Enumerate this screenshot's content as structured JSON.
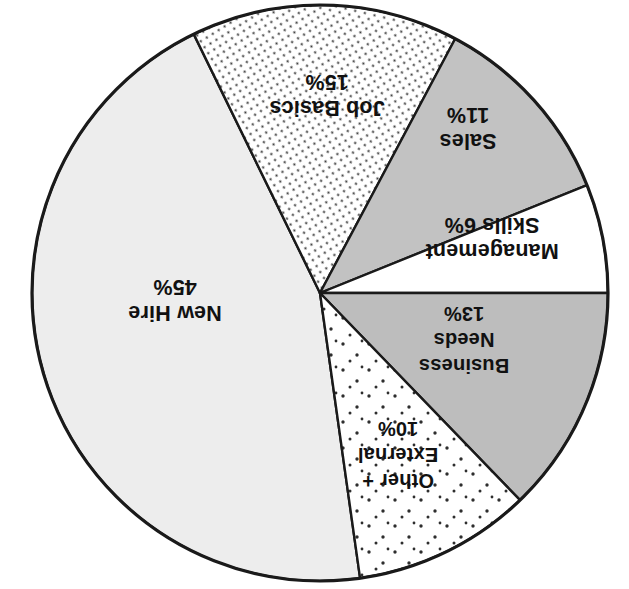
{
  "chart_data": {
    "type": "pie",
    "title": "",
    "subtitle": "",
    "xlabel": "",
    "ylabel": "",
    "legend_position": "none",
    "labels_inside_slices": true,
    "rotated_180_degrees": true,
    "total_percent": 100,
    "categories": [
      "New Hire",
      "Job Basics",
      "Sales",
      "Management Skills",
      "Business Needs",
      "Other + External"
    ],
    "values": [
      45,
      15,
      11,
      6,
      13,
      10
    ],
    "slices": [
      {
        "id": "new-hire",
        "name": "New Hire",
        "value": 45,
        "value_text": "45%",
        "label_line1": "New Hire",
        "label_line2": "45%",
        "fill": "#ededed",
        "pattern": "solid",
        "start_angle_deg": 116,
        "end_angle_deg": 278,
        "label_x": 175,
        "label_y": 300,
        "label_anchor": "middle"
      },
      {
        "id": "job-basics",
        "name": "Job Basics",
        "value": 15,
        "value_text": "15%",
        "label_line1": "Job Basics",
        "label_line2": "15%",
        "fill": "#ffffff",
        "pattern": "diagonal-dotted-hatch",
        "start_angle_deg": 62,
        "end_angle_deg": 116,
        "label_x": 327,
        "label_y": 95,
        "label_anchor": "middle"
      },
      {
        "id": "sales",
        "name": "Sales",
        "value": 11,
        "value_text": "11%",
        "label_line1": "Sales",
        "label_line2": "11%",
        "fill": "#c2c2c2",
        "pattern": "solid",
        "start_angle_deg": 22,
        "end_angle_deg": 62,
        "label_x": 468,
        "label_y": 128,
        "label_anchor": "middle"
      },
      {
        "id": "management-skills",
        "name": "Management Skills",
        "value": 6,
        "value_text": "6%",
        "label_line1": "Management",
        "label_line2": "Skills  6%",
        "fill": "#ffffff",
        "pattern": "solid",
        "start_angle_deg": 0,
        "end_angle_deg": 22,
        "label_x": 492,
        "label_y": 238,
        "label_anchor": "middle"
      },
      {
        "id": "business-needs",
        "name": "Business Needs",
        "value": 13,
        "value_text": "13%",
        "label_line1": "Business",
        "label_line2": "Needs",
        "label_line3": "13%",
        "fill": "#bdbdbd",
        "pattern": "solid",
        "start_angle_deg": 314,
        "end_angle_deg": 360,
        "label_x": 464,
        "label_y": 340,
        "label_anchor": "middle"
      },
      {
        "id": "other-external",
        "name": "Other + External",
        "value": 10,
        "value_text": "10%",
        "label_line1": "Other +",
        "label_line2": "External",
        "label_line3": "10%",
        "fill": "#ffffff",
        "pattern": "sparse-dots",
        "start_angle_deg": 278,
        "end_angle_deg": 314,
        "label_x": 398,
        "label_y": 455,
        "label_anchor": "middle"
      }
    ],
    "geometry": {
      "center_x": 320,
      "center_y": 293,
      "radius": 288
    },
    "colors": {
      "outline": "#1a1a1a",
      "text": "#111111",
      "background": "#ffffff",
      "light_gray": "#ededed",
      "medium_gray": "#c2c2c2",
      "dark_gray": "#bdbdbd",
      "white": "#ffffff"
    }
  }
}
